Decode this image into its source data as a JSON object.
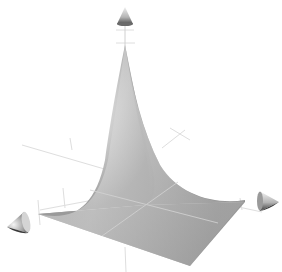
{
  "figure": {
    "kind": "3d-surface-plot",
    "colors": {
      "background": "#ffffff",
      "surface_light": "#e4e4e4",
      "surface_mid": "#b8b8b8",
      "surface_dark": "#8c8c8c",
      "gridline": "#dcdcdc",
      "cone_light": "#f0f0f0",
      "cone_dark": "#5a5a5a"
    },
    "axes": [
      {
        "name": "z-axis",
        "direction": "up",
        "arrow": "cone"
      },
      {
        "name": "x-axis",
        "direction": "left",
        "arrow": "cone"
      },
      {
        "name": "y-axis",
        "direction": "right",
        "arrow": "cone"
      }
    ],
    "labels_visible": false
  }
}
